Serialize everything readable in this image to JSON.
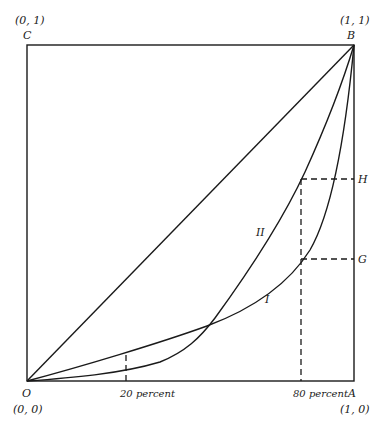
{
  "diagram": {
    "type": "lorenz-curves",
    "corners": {
      "C": {
        "label": "C",
        "coord": "(0, 1)"
      },
      "B": {
        "label": "B",
        "coord": "(1, 1)"
      },
      "O": {
        "label": "O",
        "coord": "(0, 0)"
      },
      "A": {
        "label": "A",
        "coord": "(1, 0)"
      }
    },
    "markers": {
      "H": "H",
      "G": "G"
    },
    "x_ticks": [
      {
        "label": "20 percent",
        "value": 0.2
      },
      {
        "label": "80 percent",
        "value": 0.8
      }
    ],
    "curves": [
      {
        "name": "I",
        "label": "I",
        "description": "Lorenz curve I, higher at low x, crosses curve II"
      },
      {
        "name": "II",
        "label": "II",
        "description": "Lorenz curve II, lower at low x, higher at 80 percent"
      }
    ],
    "diagonal": {
      "from": "O",
      "to": "B",
      "description": "line of equality"
    }
  }
}
